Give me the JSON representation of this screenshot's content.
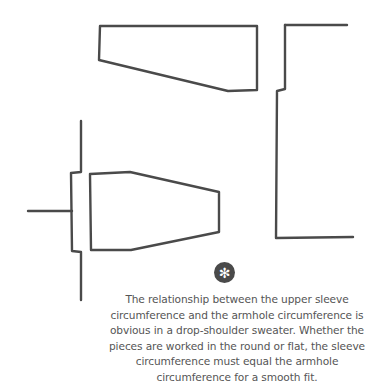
{
  "diagram": {
    "stroke_color": "#4a4a4a",
    "stroke_width": 2.4,
    "pieces": [
      {
        "name": "upper-body-piece",
        "points": "100,26 257,26 257,90 228,91 99,60 100,26"
      },
      {
        "name": "right-body-top-edge",
        "points": "285,25 347,25"
      },
      {
        "name": "right-body-side-edge",
        "points": "285,25 285,89 277,91 276,238 353,237"
      },
      {
        "name": "left-bracket",
        "points": "81,121 81,172 71,173 72,251 81,252 81,300"
      },
      {
        "name": "left-stub",
        "points": "28,211 72,211"
      },
      {
        "name": "sleeve-piece",
        "points": "90,174 130,172 219,192 219,232 131,250 91,250 90,174"
      }
    ]
  },
  "icon": {
    "name": "asterisk-icon",
    "glyph": "✻",
    "bg_color": "#4a4a4a"
  },
  "caption": {
    "text": "The relationship between the upper sleeve circumference and the armhole circumference is obvious in a drop-shoulder sweater. Whether the pieces are worked in the round or flat, the sleeve circumference must equal the armhole circumference for a smooth fit.",
    "color": "#555555"
  }
}
